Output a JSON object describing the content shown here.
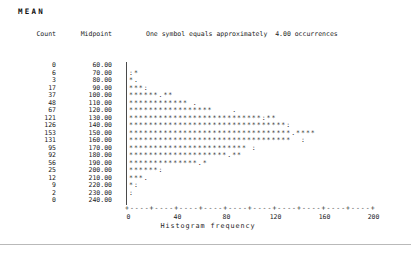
{
  "title": "MEAN",
  "header": {
    "count_label": "Count",
    "midpoint_label": "Midpoint",
    "note": "One symbol equals approximately  4.00 occurrences"
  },
  "rows": [
    {
      "count": "0",
      "midpoint": "60.00",
      "bar": ""
    },
    {
      "count": "6",
      "midpoint": "70.00",
      "bar": ":*"
    },
    {
      "count": "3",
      "midpoint": "80.00",
      "bar": "*."
    },
    {
      "count": "17",
      "midpoint": "90.00",
      "bar": "***:"
    },
    {
      "count": "37",
      "midpoint": "100.00",
      "bar": "******.**"
    },
    {
      "count": "48",
      "midpoint": "110.00",
      "bar": "************ ."
    },
    {
      "count": "67",
      "midpoint": "120.00",
      "bar": "*****************    ."
    },
    {
      "count": "121",
      "midpoint": "130.00",
      "bar": "***************************:**"
    },
    {
      "count": "126",
      "midpoint": "140.00",
      "bar": "********************************:"
    },
    {
      "count": "153",
      "midpoint": "150.00",
      "bar": "*********************************.****"
    },
    {
      "count": "131",
      "midpoint": "160.00",
      "bar": "*********************************  :"
    },
    {
      "count": "95",
      "midpoint": "170.00",
      "bar": "************************ :"
    },
    {
      "count": "92",
      "midpoint": "180.00",
      "bar": "********************.**"
    },
    {
      "count": "56",
      "midpoint": "190.00",
      "bar": "**************.*"
    },
    {
      "count": "25",
      "midpoint": "200.00",
      "bar": "******:"
    },
    {
      "count": "12",
      "midpoint": "210.00",
      "bar": "***."
    },
    {
      "count": "9",
      "midpoint": "220.00",
      "bar": "*:"
    },
    {
      "count": "2",
      "midpoint": "230.00",
      "bar": ":"
    },
    {
      "count": "0",
      "midpoint": "240.00",
      "bar": ""
    }
  ],
  "axis": {
    "line": "+----+----+----+----+----+----+----+----+----+----+",
    "tick_labels": [
      "0",
      "40",
      "80",
      "120",
      "160",
      "200"
    ],
    "xlabel": "Histogram frequency"
  },
  "chart_data": {
    "type": "bar",
    "orientation": "horizontal",
    "title": "MEAN",
    "xlabel": "Histogram frequency",
    "ylabel": "Midpoint",
    "categories": [
      60,
      70,
      80,
      90,
      100,
      110,
      120,
      130,
      140,
      150,
      160,
      170,
      180,
      190,
      200,
      210,
      220,
      230,
      240
    ],
    "values": [
      0,
      6,
      3,
      17,
      37,
      48,
      67,
      121,
      126,
      153,
      131,
      95,
      92,
      56,
      25,
      12,
      9,
      2,
      0
    ],
    "occurrences_per_symbol": 4.0,
    "xlim": [
      0,
      200
    ],
    "xticks": [
      0,
      40,
      80,
      120,
      160,
      200
    ],
    "grid": false,
    "legend_position": "none",
    "overlay": "normal-curve marks drawn with : and . characters"
  }
}
